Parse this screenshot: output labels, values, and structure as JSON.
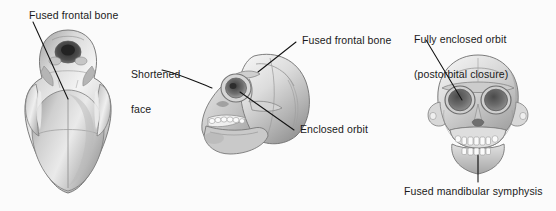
{
  "figure": {
    "background_color": "#fbfbfb",
    "ink_color": "#1a1a1a",
    "width": 556,
    "height": 211
  },
  "panels": [
    {
      "id": "ventral-view",
      "view_name": "ventral-skull-view",
      "labels": [
        {
          "id": "fused-frontal-bone-ventral",
          "text": "Fused frontal bone"
        }
      ]
    },
    {
      "id": "lateral-view",
      "view_name": "lateral-skull-view",
      "labels": [
        {
          "id": "shortened-face",
          "line1": "Shortened",
          "line2": "face"
        },
        {
          "id": "fused-frontal-bone-lateral",
          "text": "Fused frontal bone"
        },
        {
          "id": "enclosed-orbit",
          "text": "Enclosed orbit"
        }
      ]
    },
    {
      "id": "anterior-view",
      "view_name": "anterior-skull-view",
      "labels": [
        {
          "id": "fully-enclosed-orbit",
          "line1": "Fully enclosed orbit",
          "line2": "(postorbital closure)"
        },
        {
          "id": "fused-mandibular-symphysis",
          "text": "Fused mandibular symphysis"
        }
      ]
    }
  ]
}
